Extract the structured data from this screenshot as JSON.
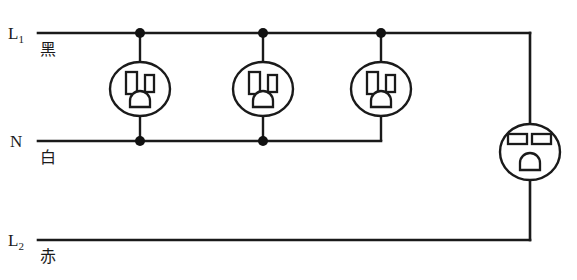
{
  "diagram": {
    "background_color": "#ffffff",
    "line_color": "#1a1a1a",
    "rails": [
      {
        "id": "l1",
        "terminal_label": "L",
        "terminal_subscript": "1",
        "color_label": "黑",
        "color_label_meaning": "black",
        "y": 33
      },
      {
        "id": "n",
        "terminal_label": "N",
        "terminal_subscript": "",
        "color_label": "白",
        "color_label_meaning": "white",
        "y": 141
      },
      {
        "id": "l2",
        "terminal_label": "L",
        "terminal_subscript": "2",
        "color_label": "赤",
        "color_label_meaning": "red",
        "y": 240
      }
    ],
    "receptacles": [
      {
        "id": "outlet-1",
        "type": "nema-5-15r",
        "volts": "120",
        "cx": 140,
        "cy": 89,
        "connects": [
          "l1",
          "n"
        ]
      },
      {
        "id": "outlet-2",
        "type": "nema-5-15r",
        "volts": "120",
        "cx": 263,
        "cy": 89,
        "connects": [
          "l1",
          "n"
        ]
      },
      {
        "id": "outlet-3",
        "type": "nema-5-15r",
        "volts": "120",
        "cx": 381,
        "cy": 89,
        "connects": [
          "l1",
          "n"
        ]
      },
      {
        "id": "outlet-4",
        "type": "nema-6-15r",
        "volts": "240",
        "cx": 530,
        "cy": 152,
        "connects": [
          "l1",
          "l2"
        ]
      }
    ],
    "junction_dots": [
      {
        "x": 140,
        "y": 33
      },
      {
        "x": 263,
        "y": 33
      },
      {
        "x": 381,
        "y": 33
      },
      {
        "x": 140,
        "y": 141
      },
      {
        "x": 263,
        "y": 141
      }
    ]
  }
}
